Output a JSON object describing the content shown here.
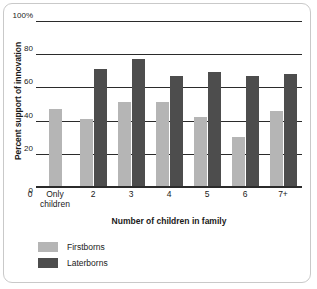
{
  "chart_data": {
    "type": "bar",
    "title": "",
    "xlabel": "Number of children in family",
    "ylabel": "Percent support of innovation",
    "categories": [
      "Only children",
      "2",
      "3",
      "4",
      "5",
      "6",
      "7+"
    ],
    "series": [
      {
        "name": "Firstborns",
        "color": "#b5b5b5",
        "values": [
          47,
          41,
          51,
          51,
          42,
          30,
          46
        ]
      },
      {
        "name": "Laterborns",
        "color": "#4d4d4d",
        "values": [
          null,
          71,
          77,
          67,
          69,
          67,
          68
        ]
      }
    ],
    "ylim": [
      0,
      100
    ],
    "yticks": [
      0,
      20,
      40,
      60,
      80,
      100
    ],
    "ytick_labels": [
      "0",
      "20",
      "40",
      "60",
      "80",
      "100%"
    ],
    "grid": true,
    "legend_position": "bottom-left",
    "origin_label": "0"
  },
  "axes": {
    "y_title": "Percent support of innovation",
    "x_title": "Number of children in family",
    "y_labels": [
      "100%",
      "80",
      "60",
      "40",
      "20",
      "0"
    ],
    "x_labels": [
      "0",
      "Only\nchildren",
      "2",
      "3",
      "4",
      "5",
      "6",
      "7+"
    ]
  },
  "legend": {
    "items": [
      {
        "label": "Firstborns",
        "color": "#b5b5b5"
      },
      {
        "label": "Laterborns",
        "color": "#4d4d4d"
      }
    ]
  }
}
